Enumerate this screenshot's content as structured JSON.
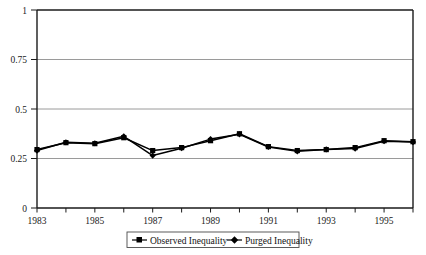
{
  "chart_data": {
    "type": "line",
    "title": "",
    "subtitle": "",
    "xlabel": "",
    "ylabel": "",
    "x": [
      1983,
      1984,
      1985,
      1986,
      1987,
      1988,
      1989,
      1990,
      1991,
      1992,
      1993,
      1994,
      1995,
      1996
    ],
    "categories": [
      "1983",
      "1984",
      "1985",
      "1986",
      "1987",
      "1988",
      "1989",
      "1990",
      "1991",
      "1992",
      "1993",
      "1994",
      "1995",
      "1996"
    ],
    "xlim": [
      1983,
      1996
    ],
    "ylim": [
      0,
      1
    ],
    "yticks": [
      0,
      0.25,
      0.5,
      0.75,
      1
    ],
    "ytick_labels": [
      "0",
      "0.25",
      "0.5",
      "0.75",
      "1"
    ],
    "xtick_labels_shown": [
      "1983",
      "1985",
      "1987",
      "1989",
      "1991",
      "1993",
      "1995"
    ],
    "xticks_all": [
      1983,
      1984,
      1985,
      1986,
      1987,
      1988,
      1989,
      1990,
      1991,
      1992,
      1993,
      1994,
      1995,
      1996
    ],
    "grid": true,
    "grid_axis": "y",
    "legend_position": "bottom",
    "series": [
      {
        "name": "Observed Inequality",
        "marker": "square",
        "color": "#000000",
        "values": [
          0.295,
          0.33,
          0.325,
          0.355,
          0.29,
          0.305,
          0.34,
          0.375,
          0.31,
          0.29,
          0.295,
          0.305,
          0.34,
          0.335
        ]
      },
      {
        "name": "Purged Inequality",
        "marker": "diamond",
        "color": "#000000",
        "values": [
          0.29,
          0.332,
          0.327,
          0.362,
          0.265,
          0.302,
          0.348,
          0.372,
          0.308,
          0.286,
          0.296,
          0.3,
          0.337,
          0.333
        ]
      }
    ]
  },
  "legend": {
    "items": [
      {
        "label": "Observed Inequality",
        "marker": "square"
      },
      {
        "label": "Purged Inequality",
        "marker": "diamond"
      }
    ]
  },
  "axes": {
    "y_tick_0": "0",
    "y_tick_1": "0.25",
    "y_tick_2": "0.5",
    "y_tick_3": "0.75",
    "y_tick_4": "1",
    "x_tick_0": "1983",
    "x_tick_1": "1985",
    "x_tick_2": "1987",
    "x_tick_3": "1989",
    "x_tick_4": "1991",
    "x_tick_5": "1993",
    "x_tick_6": "1995"
  },
  "colors": {
    "axis": "#1a1a1a",
    "grid": "#9a9a9a",
    "series": "#000000",
    "background": "#ffffff"
  }
}
